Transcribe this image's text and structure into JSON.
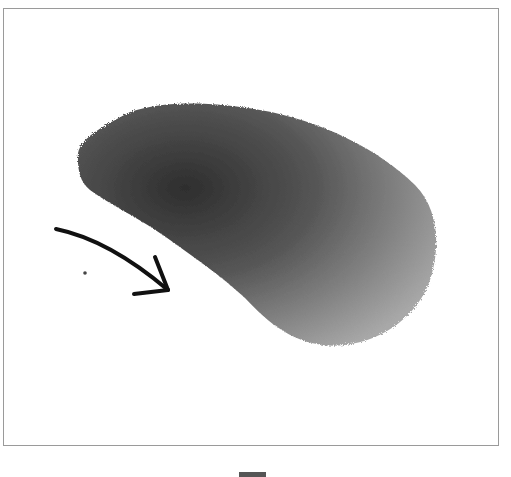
{
  "figure": {
    "annotation": "curved arrow pointing toward lateral body edge",
    "scale_bar": "scale bar (unlabeled)",
    "colors": {
      "frame": "#9a9a9a",
      "specimen_dark": "#3a3a3a",
      "specimen_light": "#9a9a9a",
      "arrow": "#111111",
      "scale_bar": "#555555"
    }
  }
}
